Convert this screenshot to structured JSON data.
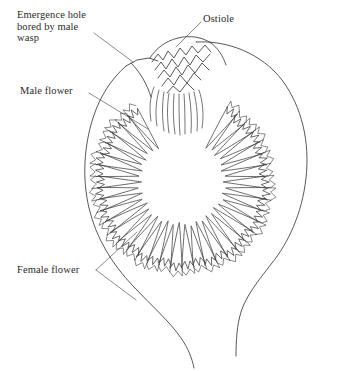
{
  "diagram": {
    "background_color": "#ffffff",
    "line_color": "#3a3a3a",
    "text_color": "#2b2b2b",
    "labels": [
      {
        "id": "emergence-hole",
        "text": "Emergence hole\nbored by male\nwasp",
        "lines": [
          "Emergence hole",
          "bored by male",
          "wasp"
        ],
        "position": "top-left",
        "leader": "from text down-right to fig wall opening"
      },
      {
        "id": "ostiole",
        "text": "Ostiole",
        "lines": [
          "Ostiole"
        ],
        "position": "top-right",
        "leader": "from text down-left to bract cluster at fig apex"
      },
      {
        "id": "male-flower",
        "text": "Male flower",
        "lines": [
          "Male flower"
        ],
        "position": "middle-left",
        "leader": "from text down-right to upper-left florets"
      },
      {
        "id": "female-flower",
        "text": "Female flower",
        "lines": [
          "Female flower"
        ],
        "position": "bottom-left",
        "leader": "from text up-right and down-right to lower florets"
      }
    ],
    "structures": {
      "outer_wall": "fig body outline, ovate, narrowing to a stalk at bottom",
      "ostiole": "zigzag overlapping bracts at apex with downward fibers",
      "cavity": "hollow central chamber",
      "floret_ring": "ring of radially arranged flask-shaped flowers pointing inward"
    },
    "floret_count": 46
  }
}
